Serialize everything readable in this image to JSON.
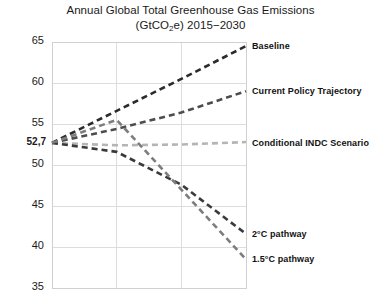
{
  "chart_data": {
    "type": "line",
    "title": "Annual Global Total Greenhouse Gas Emissions (GtCO2e) 2015−2030",
    "title_line1": "Annual Global Total Greenhouse Gas Emissions",
    "title_line2_pre": "(GtCO",
    "title_line2_sub": "2",
    "title_line2_post": "e) 2015−2030",
    "xlabel": "",
    "ylabel": "",
    "x": [
      2015,
      2020,
      2025,
      2030
    ],
    "xlim": [
      2015,
      2030
    ],
    "ylim": [
      35,
      65
    ],
    "yticks": [
      35,
      40,
      45,
      50,
      55,
      60,
      65
    ],
    "ytick_labels": [
      "35",
      "40",
      "45",
      "50",
      "55",
      "60",
      "65"
    ],
    "special_ytick": {
      "value": 52.7,
      "label": "52,7"
    },
    "xticks": [
      2015,
      2020,
      2025,
      2030
    ],
    "xtick_labels": [
      "",
      "",
      "",
      ""
    ],
    "grid": true,
    "grid_color": "#dddddd",
    "legend_position": "right-inline",
    "start_value": 52.7,
    "series": [
      {
        "name": "Baseline",
        "label": "Baseline",
        "color": "#2b2b2b",
        "style": "dashed",
        "values": [
          52.7,
          56.6,
          60.5,
          64.5
        ],
        "label_y_value": 64.4
      },
      {
        "name": "Current Policy Trajectory",
        "label": "Current Policy Trajectory",
        "color": "#4d4d4d",
        "style": "dashed",
        "values": [
          52.7,
          54.4,
          56.4,
          59.0
        ],
        "label_y_value": 58.9
      },
      {
        "name": "Conditional INDC Scenario",
        "label": "Conditional INDC Scenario",
        "color": "#b5b5b5",
        "style": "dashed",
        "values": [
          52.7,
          52.4,
          52.5,
          52.8
        ],
        "label_y_value": 52.6
      },
      {
        "name": "2 degree C pathway",
        "label": "2°C pathway",
        "color": "#3a3a3a",
        "style": "dashed",
        "values": [
          52.7,
          51.6,
          47.6,
          41.6
        ],
        "label_y_value": 41.5
      },
      {
        "name": "1.5 degree C pathway",
        "label": "1.5°C pathway",
        "color": "#7d7d7d",
        "style": "dashed",
        "values": [
          52.7,
          55.5,
          47.0,
          38.5
        ],
        "label_y_value": 38.4
      }
    ]
  }
}
